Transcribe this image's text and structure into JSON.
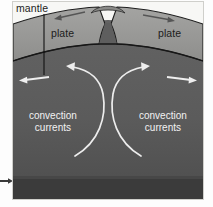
{
  "diagram": {
    "labels": {
      "mantle": "mantle",
      "plate_left": "plate",
      "plate_right": "plate",
      "convection_left_line1": "convection",
      "convection_left_line2": "currents",
      "convection_right_line1": "convection",
      "convection_right_line2": "currents"
    },
    "icons": {
      "spread_arrow_left": "arrow-left-icon",
      "spread_arrow_right": "arrow-right-icon",
      "mantle_flow_arrow_left": "arrow-left-icon",
      "mantle_flow_arrow_right": "arrow-right-icon",
      "convection_arrow_left": "curved-arrow-up-left-icon",
      "convection_arrow_right": "curved-arrow-up-right-icon",
      "margin_pointer": "arrow-right-icon",
      "mantle_leader_line": "leader-line-icon"
    },
    "colors": {
      "sky": "#f7f7f5",
      "plate": "#9a9a98",
      "mantle": "#5e5e5e",
      "mantle_deep": "#3a3a3a",
      "outline": "#1d1d1d",
      "flow_arrow": "#f0f0f0",
      "label_dark": "#1c1c1c",
      "label_light": "#f2f2f2",
      "frame_border": "#cfcfcb"
    }
  }
}
